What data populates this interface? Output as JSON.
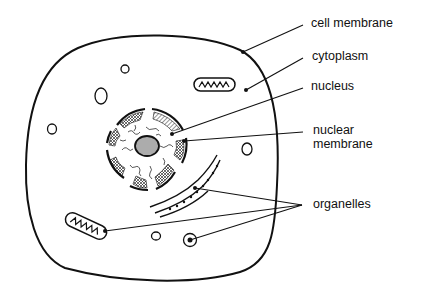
{
  "diagram": {
    "type": "animal cell",
    "labels": {
      "cell_membrane": "cell membrane",
      "cytoplasm": "cytoplasm",
      "nucleus": "nucleus",
      "nuclear_membrane_line1": "nuclear",
      "nuclear_membrane_line2": "membrane",
      "organelles": "organelles"
    }
  }
}
